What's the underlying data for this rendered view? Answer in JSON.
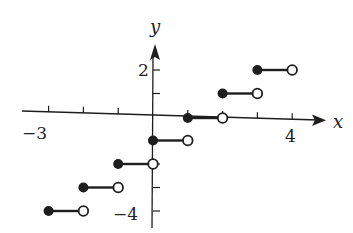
{
  "chart_data": {
    "type": "line",
    "subtype": "step",
    "title": "",
    "xlabel": "x",
    "ylabel": "y",
    "x_tick_labels": [
      {
        "value": -3,
        "label": "−3"
      },
      {
        "value": 4,
        "label": "4"
      }
    ],
    "y_tick_labels": [
      {
        "value": 2,
        "label": "2"
      },
      {
        "value": -4,
        "label": "−4"
      }
    ],
    "x_ticks": [
      -3,
      -2,
      -1,
      0,
      1,
      2,
      3,
      4
    ],
    "y_ticks": [
      2,
      1,
      0,
      -1,
      -2,
      -3,
      -4
    ],
    "xlim": [
      -3.3,
      5
    ],
    "ylim": [
      -4.8,
      3.2
    ],
    "grid": false,
    "legend": null,
    "function": "y = floor(x) - 1",
    "segments": [
      {
        "x_start": -3,
        "x_end": -2,
        "y": -4,
        "start": "closed",
        "end": "open"
      },
      {
        "x_start": -2,
        "x_end": -1,
        "y": -3,
        "start": "closed",
        "end": "open"
      },
      {
        "x_start": -1,
        "x_end": 0,
        "y": -2,
        "start": "closed",
        "end": "open"
      },
      {
        "x_start": 0,
        "x_end": 1,
        "y": -1,
        "start": "closed",
        "end": "open"
      },
      {
        "x_start": 1,
        "x_end": 2,
        "y": 0,
        "start": "closed",
        "end": "open"
      },
      {
        "x_start": 2,
        "x_end": 3,
        "y": 1,
        "start": "closed",
        "end": "open"
      },
      {
        "x_start": 3,
        "x_end": 4,
        "y": 2,
        "start": "closed",
        "end": "open"
      }
    ]
  },
  "style": {
    "ink": "#1e1e1e",
    "background": "#ffffff"
  }
}
